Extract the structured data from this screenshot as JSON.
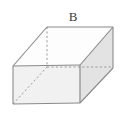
{
  "figure": {
    "label": "B",
    "shape_name": "rectangular-prism",
    "colors": {
      "background": "#ffffff",
      "edge_visible": "#8a8a8a",
      "edge_hidden": "#a8a8a8",
      "face_front": "#f0f0f0",
      "face_right": "#e2e2e2",
      "face_top": "#fdfdfd",
      "label_text": "#3a3a3a"
    },
    "vertices": {
      "front_bottom_left": [
        13,
        104
      ],
      "front_top_left": [
        13,
        66
      ],
      "front_bottom_right": [
        80,
        103
      ],
      "front_top_right": [
        80,
        65
      ],
      "back_top_left": [
        47,
        27
      ],
      "back_top_right": [
        113,
        27
      ],
      "back_bottom_left": [
        47,
        67
      ],
      "back_bottom_right": [
        113,
        68
      ]
    },
    "hidden_edges": [
      "back_top_left-back_bottom_left",
      "back_bottom_left-back_bottom_right",
      "front_bottom_left-back_bottom_left"
    ],
    "diagonal": {
      "from": "front_bottom_left",
      "to": "back_bottom_left",
      "style": "dashed"
    }
  }
}
